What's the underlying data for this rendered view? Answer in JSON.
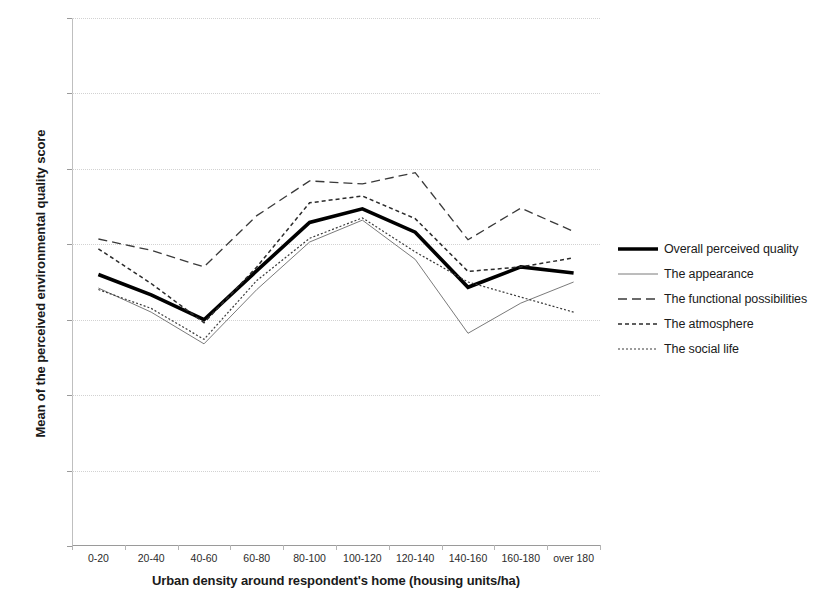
{
  "chart_data": {
    "type": "line",
    "title": "",
    "xlabel": "Urban density around respondent's home (housing units/ha)",
    "ylabel": "Mean of the perceived environmental quality score",
    "categories": [
      "0-20",
      "20-40",
      "40-60",
      "60-80",
      "80-100",
      "100-120",
      "120-140",
      "140-160",
      "160-180",
      "over 180"
    ],
    "ylim": [
      30,
      100
    ],
    "yticks": [
      30,
      40,
      50,
      60,
      70,
      80,
      90,
      100
    ],
    "grid": true,
    "legend_position": "right",
    "series": [
      {
        "name": "Overall perceived quality",
        "style": "solid-thick",
        "color": "#000000",
        "values": [
          66.0,
          63.3,
          60.0,
          66.5,
          72.9,
          74.7,
          71.6,
          64.3,
          67.0,
          66.2
        ]
      },
      {
        "name": "The appearance",
        "style": "thin-solid",
        "color": "#6b6b6b",
        "values": [
          64.2,
          61.0,
          56.8,
          64.0,
          70.3,
          73.2,
          68.0,
          58.2,
          62.2,
          65.0
        ]
      },
      {
        "name": "The functional possibilities",
        "style": "long-dash",
        "color": "#3a3a3a",
        "values": [
          70.7,
          69.2,
          67.0,
          73.8,
          78.4,
          78.0,
          79.5,
          70.6,
          74.8,
          71.7
        ]
      },
      {
        "name": "The atmosphere",
        "style": "medium-dash",
        "color": "#2b2b2b",
        "values": [
          69.4,
          64.8,
          59.6,
          67.0,
          75.5,
          76.4,
          73.4,
          66.4,
          67.0,
          68.2
        ]
      },
      {
        "name": "The social life",
        "style": "fine-dot",
        "color": "#3a3a3a",
        "values": [
          64.0,
          61.5,
          57.4,
          65.2,
          70.8,
          73.5,
          69.0,
          65.0,
          63.0,
          61.0
        ]
      }
    ]
  },
  "legend": {
    "items": [
      {
        "label": "Overall perceived quality"
      },
      {
        "label": "The appearance"
      },
      {
        "label": "The functional possibilities"
      },
      {
        "label": "The atmosphere"
      },
      {
        "label": "The social life"
      }
    ]
  }
}
